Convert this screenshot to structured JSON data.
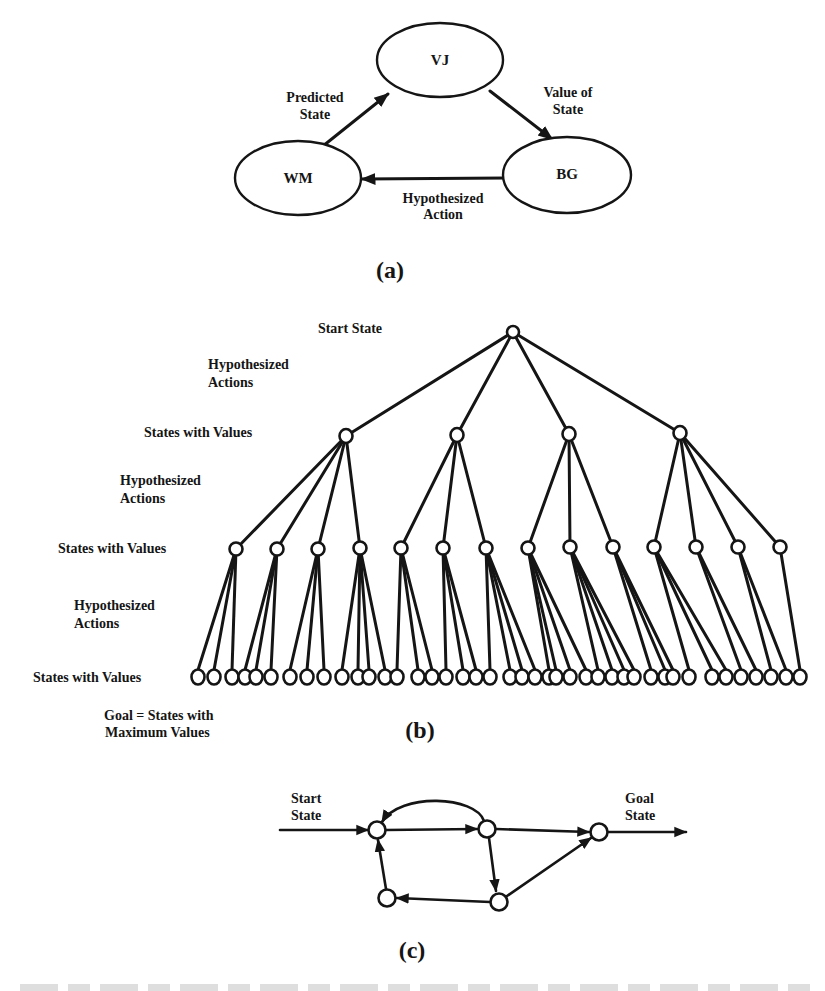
{
  "figure_a": {
    "caption": "(a)",
    "nodes": [
      {
        "id": "VJ",
        "label": "VJ",
        "cx": 462,
        "cy": 58,
        "rx": 62,
        "ry": 37
      },
      {
        "id": "WM",
        "label": "WM",
        "cx": 298,
        "cy": 175,
        "rx": 63,
        "ry": 37
      },
      {
        "id": "BG",
        "label": "BG",
        "cx": 567,
        "cy": 171,
        "rx": 63,
        "ry": 37
      }
    ],
    "edges": [
      {
        "from": "WM",
        "to": "VJ",
        "label_lines": [
          "Predicted",
          "State"
        ]
      },
      {
        "from": "VJ",
        "to": "BG",
        "label_lines": [
          "Value of",
          "State"
        ]
      },
      {
        "from": "BG",
        "to": "WM",
        "label_lines": [
          "Hypothesized",
          "Action"
        ]
      }
    ]
  },
  "figure_b": {
    "caption": "(b)",
    "labels": {
      "start_state": "Start State",
      "hyp_actions_1": [
        "Hypothesized",
        "Actions"
      ],
      "states_values_1": "States with Values",
      "hyp_actions_2": [
        "Hypothesized",
        "Actions"
      ],
      "states_values_2": "States with Values",
      "hyp_actions_3": [
        "Hypothesized",
        "Actions"
      ],
      "states_values_3": "States with Values",
      "goal_note": [
        "Goal = States with",
        "Maximum Values"
      ]
    },
    "root": {
      "x": 513,
      "y": 332
    },
    "level1": [
      {
        "x": 346,
        "y": 436
      },
      {
        "x": 457,
        "y": 435
      },
      {
        "x": 569,
        "y": 434
      },
      {
        "x": 680,
        "y": 433
      }
    ],
    "level2": [
      {
        "x": 236,
        "y": 549,
        "parent": 0
      },
      {
        "x": 277,
        "y": 549,
        "parent": 0
      },
      {
        "x": 318,
        "y": 549,
        "parent": 0
      },
      {
        "x": 360,
        "y": 548,
        "parent": 0
      },
      {
        "x": 401,
        "y": 548,
        "parent": 1
      },
      {
        "x": 443,
        "y": 548,
        "parent": 1
      },
      {
        "x": 486,
        "y": 548,
        "parent": 1
      },
      {
        "x": 528,
        "y": 548,
        "parent": 2
      },
      {
        "x": 570,
        "y": 547,
        "parent": 2
      },
      {
        "x": 613,
        "y": 547,
        "parent": 2
      },
      {
        "x": 654,
        "y": 547,
        "parent": 3
      },
      {
        "x": 696,
        "y": 547,
        "parent": 3
      },
      {
        "x": 738,
        "y": 547,
        "parent": 3
      },
      {
        "x": 780,
        "y": 547,
        "parent": 3
      }
    ],
    "leaves": [
      {
        "x": 198,
        "parent": 0
      },
      {
        "x": 214,
        "parent": 0
      },
      {
        "x": 232,
        "parent": 0
      },
      {
        "x": 245,
        "parent": 1
      },
      {
        "x": 256,
        "parent": 1
      },
      {
        "x": 271,
        "parent": 1
      },
      {
        "x": 290,
        "parent": 2
      },
      {
        "x": 307,
        "parent": 2
      },
      {
        "x": 324,
        "parent": 2
      },
      {
        "x": 342,
        "parent": 3
      },
      {
        "x": 358,
        "parent": 3
      },
      {
        "x": 369,
        "parent": 3
      },
      {
        "x": 385,
        "parent": 3
      },
      {
        "x": 397,
        "parent": 4
      },
      {
        "x": 418,
        "parent": 4
      },
      {
        "x": 432,
        "parent": 4
      },
      {
        "x": 446,
        "parent": 5
      },
      {
        "x": 463,
        "parent": 5
      },
      {
        "x": 476,
        "parent": 5
      },
      {
        "x": 490,
        "parent": 6
      },
      {
        "x": 510,
        "parent": 6
      },
      {
        "x": 522,
        "parent": 6
      },
      {
        "x": 535,
        "parent": 6
      },
      {
        "x": 549,
        "parent": 7
      },
      {
        "x": 556,
        "parent": 7
      },
      {
        "x": 570,
        "parent": 7
      },
      {
        "x": 586,
        "parent": 7
      },
      {
        "x": 598,
        "parent": 8
      },
      {
        "x": 612,
        "parent": 8
      },
      {
        "x": 624,
        "parent": 8
      },
      {
        "x": 634,
        "parent": 8
      },
      {
        "x": 651,
        "parent": 9
      },
      {
        "x": 665,
        "parent": 9
      },
      {
        "x": 673,
        "parent": 9
      },
      {
        "x": 689,
        "parent": 10
      },
      {
        "x": 712,
        "parent": 10
      },
      {
        "x": 726,
        "parent": 10
      },
      {
        "x": 741,
        "parent": 11
      },
      {
        "x": 756,
        "parent": 11
      },
      {
        "x": 771,
        "parent": 12
      },
      {
        "x": 786,
        "parent": 12
      },
      {
        "x": 800,
        "parent": 13
      }
    ],
    "leaf_y": 677
  },
  "figure_c": {
    "caption": "(c)",
    "labels": {
      "start": [
        "Start",
        "State"
      ],
      "goal": [
        "Goal",
        "State"
      ]
    },
    "nodes": [
      {
        "id": "A",
        "x": 377,
        "y": 830
      },
      {
        "id": "B",
        "x": 487,
        "y": 829
      },
      {
        "id": "G",
        "x": 599,
        "y": 832
      },
      {
        "id": "C",
        "x": 387,
        "y": 898
      },
      {
        "id": "D",
        "x": 499,
        "y": 902
      }
    ]
  }
}
